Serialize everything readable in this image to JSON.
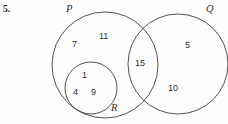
{
  "question": {
    "number": "5."
  },
  "diagram": {
    "type": "venn-diagram",
    "sets": [
      {
        "key": "P",
        "label": "P",
        "label_x": 66,
        "label_y": 4,
        "cx": 105,
        "cy": 65,
        "r": 53
      },
      {
        "key": "Q",
        "label": "Q",
        "label_x": 206,
        "label_y": 4,
        "cx": 178,
        "cy": 64,
        "r": 50
      },
      {
        "key": "R",
        "label": "R",
        "label_x": 111,
        "label_y": 103,
        "cx": 91,
        "cy": 88,
        "r": 26
      }
    ],
    "regions": [
      {
        "name": "P-only-upper-left",
        "value": "7",
        "x": 72,
        "y": 40
      },
      {
        "name": "P-only-upper",
        "value": "11",
        "x": 99,
        "y": 32
      },
      {
        "name": "R-inner-top",
        "value": "1",
        "x": 82,
        "y": 71
      },
      {
        "name": "R-inner-lower-left",
        "value": "4",
        "x": 73,
        "y": 88
      },
      {
        "name": "R-inner-lower-right",
        "value": "9",
        "x": 91,
        "y": 88
      },
      {
        "name": "P-and-Q-intersect",
        "value": "15",
        "x": 135,
        "y": 59
      },
      {
        "name": "Q-only-upper",
        "value": "5",
        "x": 185,
        "y": 41
      },
      {
        "name": "Q-only-lower",
        "value": "10",
        "x": 168,
        "y": 84
      }
    ]
  },
  "colors": {
    "stroke": "#3d3d3d",
    "background": "#fdfdfd",
    "text": "#1a1a1a"
  }
}
